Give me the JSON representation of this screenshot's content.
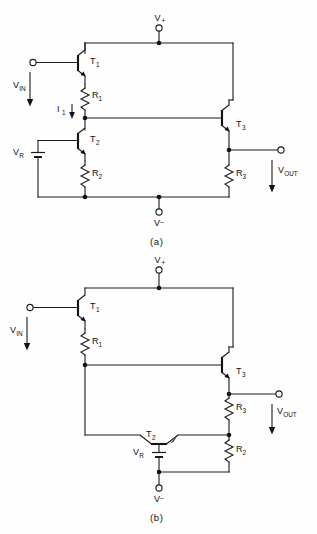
{
  "figure": {
    "type": "electronic-schematic",
    "background_color": "#fefefe",
    "line_color": "#1a1a1a"
  },
  "captions": {
    "a": "(a)",
    "b": "(b)"
  },
  "panel_a": {
    "id": "a",
    "terminals": {
      "vplus": "V",
      "vplus_sub": "+",
      "vminus": "V",
      "vminus_sub": "–",
      "vin": "V",
      "vin_sub": "IN",
      "vout": "V",
      "vout_sub": "OUT"
    },
    "transistors": [
      {
        "name": "T",
        "sub": "1",
        "label": "T₁",
        "type": "npn",
        "orientation": "left-facing"
      },
      {
        "name": "T",
        "sub": "2",
        "label": "T₂",
        "type": "npn",
        "orientation": "left-facing"
      },
      {
        "name": "T",
        "sub": "3",
        "label": "T₃",
        "type": "npn",
        "orientation": "left-facing"
      }
    ],
    "resistors": [
      {
        "name": "R",
        "sub": "1",
        "label": "R₁"
      },
      {
        "name": "R",
        "sub": "2",
        "label": "R₂"
      },
      {
        "name": "R",
        "sub": "3",
        "label": "R₃"
      }
    ],
    "sources": [
      {
        "name": "V",
        "sub": "R",
        "label": "Vʀ",
        "type": "battery"
      }
    ],
    "currents": [
      {
        "name": "I",
        "sub": "1",
        "label": "I₁",
        "direction": "down"
      }
    ]
  },
  "panel_b": {
    "id": "b",
    "terminals": {
      "vplus": "V",
      "vplus_sub": "+",
      "vminus": "V",
      "vminus_sub": "–",
      "vin": "V",
      "vin_sub": "IN",
      "vout": "V",
      "vout_sub": "OUT"
    },
    "transistors": [
      {
        "name": "T",
        "sub": "1",
        "label": "T₁",
        "type": "npn",
        "orientation": "left-facing"
      },
      {
        "name": "T",
        "sub": "2",
        "label": "T₂",
        "type": "npn",
        "orientation": "horizontal"
      },
      {
        "name": "T",
        "sub": "3",
        "label": "T₃",
        "type": "npn",
        "orientation": "left-facing"
      }
    ],
    "resistors": [
      {
        "name": "R",
        "sub": "1",
        "label": "R₁"
      },
      {
        "name": "R",
        "sub": "2",
        "label": "R₂"
      },
      {
        "name": "R",
        "sub": "3",
        "label": "R₃"
      }
    ],
    "sources": [
      {
        "name": "V",
        "sub": "R",
        "label": "Vʀ",
        "type": "battery"
      }
    ]
  }
}
